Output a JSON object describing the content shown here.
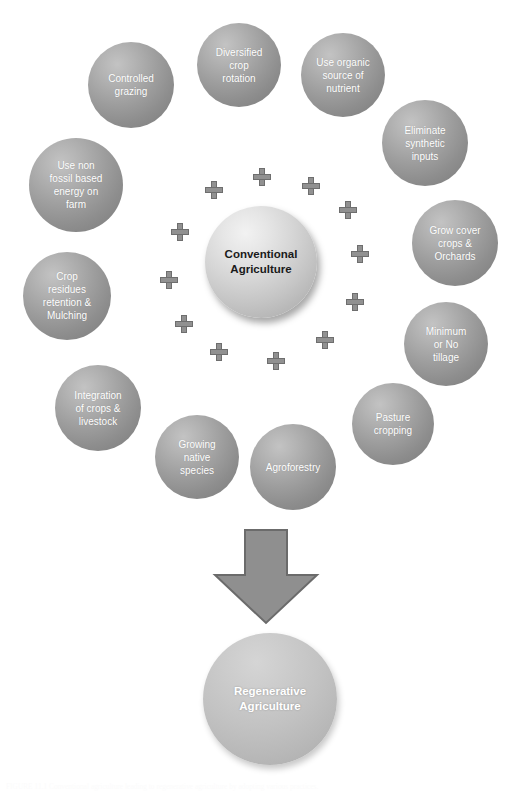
{
  "figure": {
    "caption": "FIGURE 11.1   Conventional agriculture leading to regenerative agriculture by adopting various practices."
  },
  "colors": {
    "background": "#ffffff",
    "bubble_fill": "#9d9d9d",
    "bubble_text": "#ffffff",
    "center_fill": "#d6d6d6",
    "center_text": "#1a1a1a",
    "outcome_fill": "#c2c2c2",
    "outcome_text": "#ffffff",
    "plus_fill": "#919191",
    "plus_stroke": "#6e6e6e",
    "arrow_fill": "#8f8f8f",
    "arrow_stroke": "#6b6b6b"
  },
  "center": {
    "label": "Conventional\nAgriculture"
  },
  "outcome": {
    "label": "Regenerative\nAgriculture"
  },
  "arrow": {
    "name": "down-arrow",
    "direction": "down"
  },
  "practices": [
    {
      "id": "controlled-grazing",
      "label": "Controlled\ngrazing"
    },
    {
      "id": "diversified-crop-rotation",
      "label": "Diversified\ncrop\nrotation"
    },
    {
      "id": "use-organic-source",
      "label": "Use organic\nsource of\nnutrient"
    },
    {
      "id": "eliminate-synthetic",
      "label": "Eliminate\nsynthetic\ninputs"
    },
    {
      "id": "grow-cover-crops",
      "label": "Grow cover\ncrops &\nOrchards"
    },
    {
      "id": "minimum-or-no-tillage",
      "label": "Minimum\nor No\ntillage"
    },
    {
      "id": "pasture-cropping",
      "label": "Pasture\ncropping"
    },
    {
      "id": "agroforestry",
      "label": "Agroforestry"
    },
    {
      "id": "growing-native-species",
      "label": "Growing\nnative\nspecies"
    },
    {
      "id": "integration-crops-livestock",
      "label": "Integration\nof crops &\nlivestock"
    },
    {
      "id": "crop-residues-mulching",
      "label": "Crop\nresidues\nretention &\nMulching"
    },
    {
      "id": "non-fossil-energy",
      "label": "Use non\nfossil based\nenergy on\nfarm"
    }
  ],
  "plus_signs": {
    "count": 12,
    "symbol": "+"
  }
}
